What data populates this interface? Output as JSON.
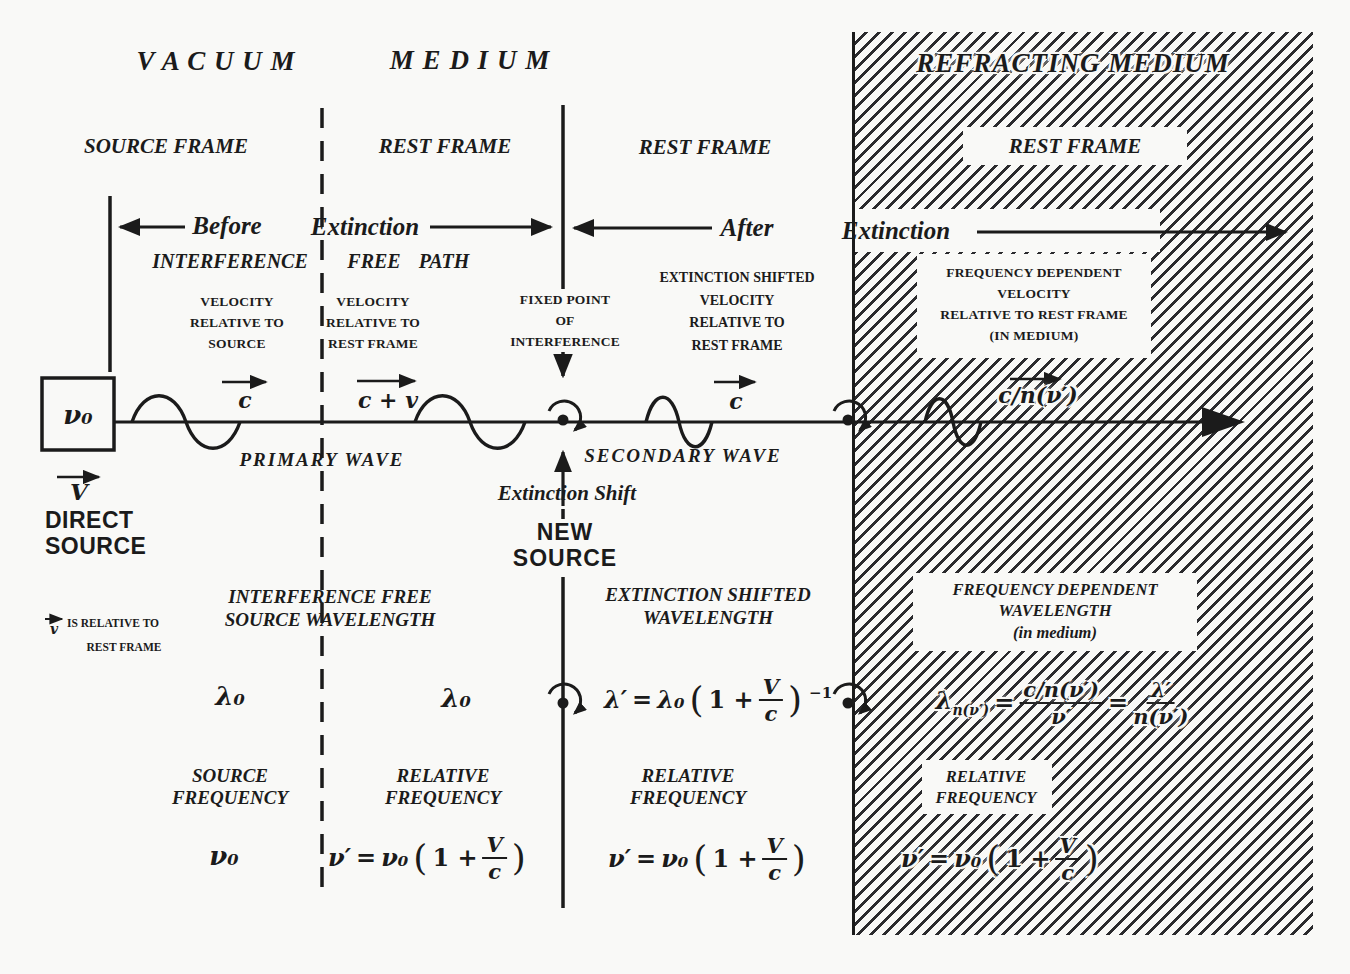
{
  "colors": {
    "paper": "#f9f9f7",
    "ink": "#1b1b1b"
  },
  "regions": {
    "vacuum_title": "V A C U U M",
    "medium_title": "M E D I U M",
    "refracting_title": "REFRACTING  MEDIUM",
    "frame1": "SOURCE  FRAME",
    "frame2": "REST FRAME",
    "frame3": "REST FRAME",
    "frame4": "REST FRAME"
  },
  "phase": {
    "before": "Before",
    "extinction_left": "Extinction",
    "after": "After",
    "extinction_right": "Extinction",
    "path": [
      "INTERFERENCE",
      "FREE",
      "PATH"
    ]
  },
  "labels": {
    "vel1": [
      "VELOCITY",
      "RELATIVE TO",
      "SOURCE"
    ],
    "vel2": [
      "VELOCITY",
      "RELATIVE TO",
      "REST FRAME"
    ],
    "fixed_point": [
      "FIXED POINT",
      "OF",
      "INTERFERENCE"
    ],
    "vel3": [
      "EXTINCTION SHIFTED",
      "VELOCITY",
      "RELATIVE TO",
      "REST FRAME"
    ],
    "vel4": [
      "FREQUENCY DEPENDENT",
      "VELOCITY",
      "RELATIVE TO REST FRAME",
      "(IN  MEDIUM)"
    ],
    "primary_wave": "PRIMARY  WAVE",
    "secondary_wave": "SECONDARY  WAVE",
    "extinction_shift": "Extinction  Shift",
    "new_source": [
      "NEW",
      "SOURCE"
    ],
    "direct_source": [
      "DIRECT",
      "SOURCE"
    ],
    "v_vector": "V",
    "v_note_v": "v",
    "v_note": [
      "IS RELATIVE TO",
      "REST FRAME"
    ],
    "wavelength2_title": [
      "INTERFERENCE  FREE",
      "SOURCE WAVELENGTH"
    ],
    "wavelength3_title": [
      "EXTINCTION  SHIFTED",
      "WAVELENGTH"
    ],
    "wavelength4_title": [
      "FREQUENCY  DEPENDENT",
      "WAVELENGTH",
      "(in  medium)"
    ],
    "freq1_title": [
      "SOURCE",
      "FREQUENCY"
    ],
    "freq2_title": [
      "RELATIVE",
      "FREQUENCY"
    ],
    "freq3_title": [
      "RELATIVE",
      "FREQUENCY"
    ],
    "freq4_title": [
      "RELATIVE",
      "FREQUENCY"
    ]
  },
  "symbols": {
    "source_frequency": "ν₀",
    "speed1": "c",
    "speed2": "c + v",
    "speed3": "c",
    "speed4": "c/n(ν′)"
  },
  "formulas": {
    "lambda1": "λ₀",
    "lambda2": "λ₀",
    "lambda3": {
      "lhs": "λ′",
      "eq": "=",
      "coef": "λ₀",
      "open": "(",
      "one_plus": "1 +",
      "num": "V",
      "den": "c",
      "close": ")",
      "sup": "−1"
    },
    "lambda4": {
      "base": "λ",
      "sub": "n(ν′)",
      "eq1": "=",
      "num1": "c/n(ν′)",
      "den1": "ν′",
      "eq2": "=",
      "num2": "λ′",
      "den2": "n(ν′)"
    },
    "nu1": "ν₀",
    "nu2": {
      "lhs": "ν′",
      "eq": "=",
      "coef": "ν₀",
      "open": "(",
      "one_plus": "1 +",
      "num": "V",
      "den": "c",
      "close": ")"
    },
    "nu3": {
      "lhs": "ν′",
      "eq": "=",
      "coef": "ν₀",
      "open": "(",
      "one_plus": "1 +",
      "num": "V",
      "den": "c",
      "close": ")"
    },
    "nu4": {
      "lhs": "ν′",
      "eq": "=",
      "coef": "ν₀",
      "open": "(",
      "one_plus": "1 +",
      "num": "V",
      "den": "c",
      "close": ")"
    }
  }
}
